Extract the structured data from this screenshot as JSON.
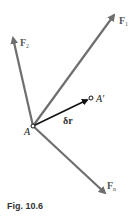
{
  "figure": {
    "caption": "Fig. 10.6",
    "colors": {
      "force_arrow": "#6e6e6e",
      "displacement_arrow": "#111111",
      "background": "#ffffff"
    },
    "points": {
      "A": {
        "label": "A",
        "x": 33,
        "y": 126
      },
      "A_prime": {
        "label": "A′",
        "x": 91,
        "y": 98
      }
    },
    "forces": [
      {
        "name": "F1",
        "symbol": "F",
        "subscript": "1",
        "tip": [
          116,
          13
        ]
      },
      {
        "name": "F2",
        "symbol": "F",
        "subscript": "2",
        "tip": [
          12,
          35
        ]
      },
      {
        "name": "Fn",
        "symbol": "F",
        "subscript": "n",
        "tip": [
          107,
          195
        ]
      }
    ],
    "displacement": {
      "label": "δr",
      "from": "A",
      "to": "A_prime"
    }
  }
}
